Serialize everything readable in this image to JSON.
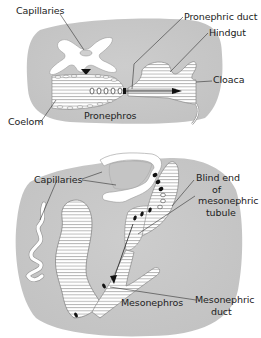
{
  "figure": {
    "top_panel": {
      "name": "Pronephros",
      "labels": {
        "capillaries": "Capillaries",
        "pronephric_duct": "Pronephric duct",
        "hindgut": "Hindgut",
        "cloaca": "Cloaca",
        "coelom": "Coelom",
        "pronephros": "Pronephros"
      }
    },
    "bottom_panel": {
      "name": "Mesonephros",
      "labels": {
        "capillaries": "Capillaries",
        "blind_end_line1": "Blind end",
        "blind_end_line2": "of",
        "blind_end_line3": "mesonephric",
        "blind_end_line4": "tubule",
        "mesonephros": "Mesonephros",
        "mesonephric_duct_line1": "Mesonephric",
        "mesonephric_duct_line2": "duct"
      }
    },
    "colors": {
      "tissue": "#c9c9c9",
      "hatch": "#9a9a9a",
      "outline": "#777777",
      "capillary": "#ffffff",
      "leader": "#333333",
      "marker": "#111111"
    }
  }
}
